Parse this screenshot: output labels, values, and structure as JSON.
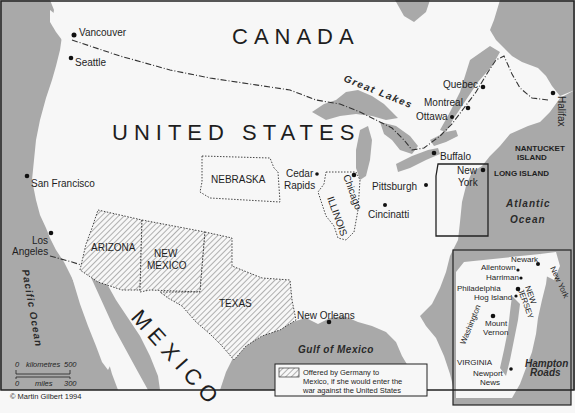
{
  "map": {
    "title": "Zimmermann Telegram: territory offered to Mexico",
    "colors": {
      "land": "#f7f7f7",
      "water": "#a9a9a9",
      "border": "#2b2b2b",
      "hatch": "#555555",
      "frame": "#333333"
    },
    "countries": {
      "canada": "CANADA",
      "united_states": "UNITED STATES",
      "mexico": "MEXICO"
    },
    "states": {
      "nebraska": "NEBRASKA",
      "illinois": "ILLINOIS",
      "arizona": "ARIZONA",
      "new_mexico_line1": "NEW",
      "new_mexico_line2": "MEXICO",
      "texas": "TEXAS",
      "virginia": "VIRGINIA",
      "new_jersey_line1": "NEW",
      "new_jersey_line2": "JERSEY",
      "new_york_inset": "New York"
    },
    "cities": {
      "vancouver": "Vancouver",
      "seattle": "Seattle",
      "san_francisco": "San Francisco",
      "los_angeles_line1": "Los",
      "los_angeles_line2": "Angeles",
      "cedar_rapids_line1": "Cedar",
      "cedar_rapids_line2": "Rapids",
      "chicago": "Chicago",
      "pittsburgh": "Pittsburgh",
      "cincinnati": "Cincinatti",
      "buffalo": "Buffalo",
      "new_york_line1": "New",
      "new_york_line2": "York",
      "quebec": "Quebec",
      "montreal": "Montreal",
      "ottawa": "Ottawa",
      "halifax": "Halifax",
      "new_orleans": "New Orleans"
    },
    "islands": {
      "nantucket_line1": "NANTUCKET",
      "nantucket_line2": "ISLAND",
      "long_island": "LONG ISLAND"
    },
    "water": {
      "great_lakes": "Great Lakes",
      "atlantic_line1": "Atlantic",
      "atlantic_line2": "Ocean",
      "pacific": "Pacific Ocean",
      "gulf": "Gulf of Mexico",
      "hampton_line1": "Hampton",
      "hampton_line2": "Roads"
    },
    "inset": {
      "newark": "Newark",
      "allentown": "Allentown",
      "harriman": "Harriman",
      "philadelphia": "Philadelphia",
      "hog_island": "Hog Island",
      "washington": "Washington",
      "mount_vernon_line1": "Mount",
      "mount_vernon_line2": "Vernon",
      "newport_news_line1": "Newport",
      "newport_news_line2": "News"
    },
    "legend": {
      "line1": "Offered by Germany to",
      "line2": "Mexico, if she would enter the",
      "line3": "war against the United States"
    },
    "scale": {
      "km_start": "0",
      "km_label": "kilometres",
      "km_end": "500",
      "mi_start": "0",
      "mi_label": "miles",
      "mi_end": "300"
    },
    "copyright": "© Martin Gilbert 1994"
  }
}
